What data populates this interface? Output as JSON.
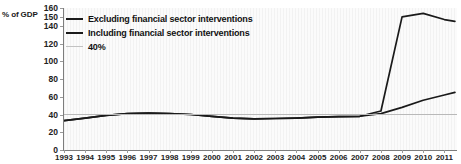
{
  "chart_data": {
    "type": "line",
    "title": "",
    "xlabel": "",
    "ylabel": "% of GDP",
    "xlim": [
      1993,
      2011.6
    ],
    "ylim": [
      0,
      160
    ],
    "grid": false,
    "legend_position": "top-left",
    "x_ticks": [
      "1993",
      "1994",
      "1995",
      "1996",
      "1997",
      "1998",
      "1999",
      "2000",
      "2001",
      "2002",
      "2003",
      "2004",
      "2005",
      "2006",
      "2007",
      "2008",
      "2009",
      "2010",
      "2011"
    ],
    "y_ticks": [
      0,
      20,
      40,
      60,
      80,
      100,
      120,
      140,
      150,
      160
    ],
    "x": [
      1993,
      1994,
      1995,
      1996,
      1997,
      1998,
      1999,
      2000,
      2001,
      2002,
      2003,
      2004,
      2005,
      2006,
      2007,
      2008,
      2009,
      2010,
      2011,
      2011.5
    ],
    "series": [
      {
        "name": "Excluding financial sector interventions",
        "color": "#1a1a1a",
        "width": 1.7,
        "values": [
          33,
          36,
          39,
          41,
          41.5,
          41,
          40,
          38,
          36,
          35,
          35.5,
          36,
          37,
          37.5,
          38,
          41,
          48,
          56,
          62,
          65
        ]
      },
      {
        "name": "Including financial sector interventions",
        "color": "#1a1a1a",
        "width": 1.7,
        "values": [
          33,
          36,
          39,
          41,
          41.5,
          41,
          40,
          38,
          36,
          35,
          35.5,
          36,
          37,
          37.5,
          38,
          44,
          150,
          154,
          147,
          145
        ]
      },
      {
        "name": "40%",
        "color": "#b9b9b9",
        "width": 1.0,
        "constant": 40
      }
    ],
    "legend": [
      {
        "label": "Excluding financial sector interventions",
        "color": "#1a1a1a",
        "width": 2.4
      },
      {
        "label": "Including financial sector interventions",
        "color": "#1a1a1a",
        "width": 2.0
      },
      {
        "label": "40%",
        "color": "#c2c2c2",
        "width": 1.4
      }
    ]
  },
  "colors": {
    "axis": "#7d7d7d",
    "plot_bg": "#fbfbfb",
    "page_bg": "#ffffff",
    "text": "#1a1a1a"
  }
}
